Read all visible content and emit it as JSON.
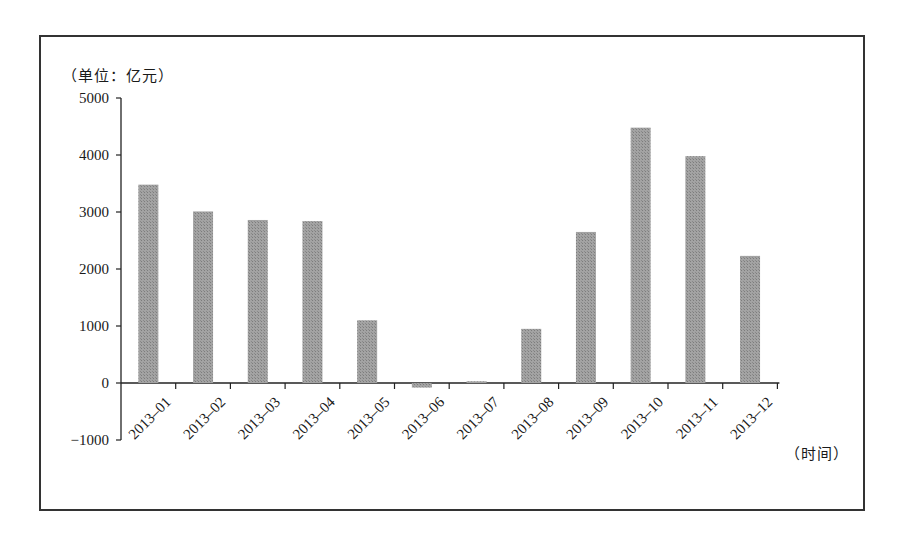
{
  "chart_data": {
    "type": "bar",
    "title": "",
    "unit_label": "（单位：亿元）",
    "xlabel": "（时间）",
    "ylabel": "（单位：亿元）",
    "categories": [
      "2013-01",
      "2013-02",
      "2013-03",
      "2013-04",
      "2013-05",
      "2013-06",
      "2013-07",
      "2013-08",
      "2013-09",
      "2013-10",
      "2013-11",
      "2013-12"
    ],
    "values": [
      3480,
      3010,
      2860,
      2840,
      1100,
      -80,
      30,
      950,
      2650,
      4480,
      3980,
      2230
    ],
    "ylim": [
      -1000,
      5000
    ],
    "yticks": [
      -1000,
      0,
      1000,
      2000,
      3000,
      4000,
      5000
    ],
    "ytick_labels": [
      "−1000",
      "0",
      "1000",
      "2000",
      "3000",
      "4000",
      "5000"
    ],
    "grid": false,
    "legend": null,
    "bar_color": "#9c9c9c"
  }
}
